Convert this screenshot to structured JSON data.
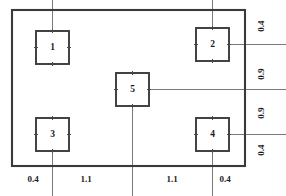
{
  "drawing": {
    "type": "dimensioned-layout-plan",
    "canvas": {
      "width": 286,
      "height": 196
    },
    "outer_boundary": {
      "name": "outer-rectangle",
      "x": 12,
      "y": 10,
      "width": 233,
      "height": 156
    },
    "boxes": [
      {
        "id": "1",
        "label": "1",
        "x": 36,
        "y": 31,
        "size": 33,
        "leaders": [
          "up"
        ]
      },
      {
        "id": "2",
        "label": "2",
        "x": 196,
        "y": 28,
        "size": 33,
        "leaders": [
          "up",
          "right"
        ]
      },
      {
        "id": "5",
        "label": "5",
        "x": 116,
        "y": 73,
        "size": 33,
        "leaders": [
          "down",
          "right"
        ]
      },
      {
        "id": "3",
        "label": "3",
        "x": 36,
        "y": 118,
        "size": 33,
        "leaders": [
          "down"
        ]
      },
      {
        "id": "4",
        "label": "4",
        "x": 196,
        "y": 118,
        "size": 33,
        "leaders": [
          "down",
          "right"
        ]
      }
    ],
    "dimensions": {
      "bottom": {
        "name": "horizontal-dimension-chain",
        "orientation": "horizontal",
        "values": [
          "0.4",
          "1.1",
          "1.1",
          "0.4"
        ],
        "label_y": 180,
        "label_x": [
          33,
          86,
          172,
          225
        ],
        "station_x": [
          12,
          53,
          132,
          212,
          245
        ]
      },
      "right": {
        "name": "vertical-dimension-chain",
        "orientation": "vertical",
        "rotated": true,
        "values": [
          "0.4",
          "0.9",
          "0.9",
          "0.4"
        ],
        "label_x": 262,
        "label_y": [
          26,
          74,
          113,
          150
        ],
        "station_y": [
          10,
          45,
          90,
          134,
          166
        ]
      }
    },
    "colors": {
      "outline": "#3a3a3a",
      "extension_line": "#6a6a6a",
      "tick": "#4a4a4a",
      "text": "#1c1c1c",
      "background": "#ffffff"
    }
  }
}
